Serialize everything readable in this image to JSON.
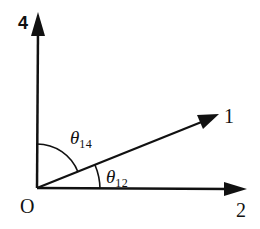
{
  "diagram": {
    "origin": {
      "label": "O",
      "x": 37,
      "y": 188
    },
    "vectors": [
      {
        "id": "4",
        "label": "4",
        "tip": [
          38,
          14
        ],
        "direction": "vertical-up"
      },
      {
        "id": "1",
        "label": "1",
        "tip": [
          217,
          115
        ],
        "direction": "diagonal-up-right"
      },
      {
        "id": "2",
        "label": "2",
        "tip": [
          245,
          189
        ],
        "direction": "horizontal-right"
      }
    ],
    "angles": [
      {
        "id": "theta14",
        "symbol": "θ",
        "subscript": "14",
        "between": [
          "4",
          "1"
        ]
      },
      {
        "id": "theta12",
        "symbol": "θ",
        "subscript": "12",
        "between": [
          "1",
          "2"
        ]
      }
    ],
    "stroke_color": "#111111"
  }
}
